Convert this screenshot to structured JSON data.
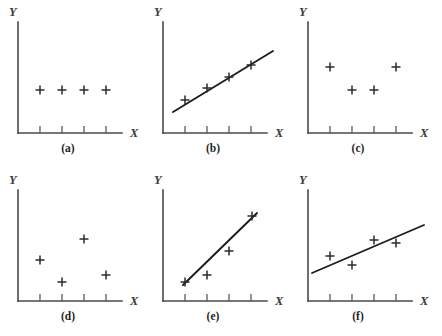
{
  "figure": {
    "background_color": "#ffffff",
    "axis_color": "#4a4a4a",
    "line_color": "#1c1c1c",
    "marker_color": "#2a2a2a",
    "marker_glyph": "plus",
    "panel_count": 6,
    "columns": 3,
    "rows": 2
  },
  "chart_data": [
    {
      "type": "scatter",
      "title": "(a)",
      "xlabel": "X",
      "ylabel": "Y",
      "x": [
        1,
        2,
        3,
        4
      ],
      "y": [
        3,
        3,
        3,
        3
      ],
      "xticks": [
        1,
        2,
        3,
        4
      ],
      "yticks": [],
      "grid": false,
      "legend": null,
      "trend_line": null,
      "description": "no correlation - flat horizontal scatter"
    },
    {
      "type": "scatter",
      "title": "(b)",
      "xlabel": "X",
      "ylabel": "Y",
      "x": [
        1,
        2,
        3,
        4
      ],
      "y": [
        1.55,
        2.22,
        2.9,
        3.58
      ],
      "xticks": [
        1,
        2,
        3,
        4
      ],
      "yticks": [],
      "grid": false,
      "legend": null,
      "trend_line": {
        "x": [
          0.45,
          4.95
        ],
        "y": [
          1.18,
          4.22
        ]
      },
      "description": "perfect positive linear correlation"
    },
    {
      "type": "scatter",
      "title": "(c)",
      "xlabel": "X",
      "ylabel": "Y",
      "x": [
        1,
        2,
        3,
        4
      ],
      "y": [
        3.65,
        2.6,
        2.6,
        3.65
      ],
      "xticks": [
        1,
        2,
        3,
        4
      ],
      "yticks": [],
      "grid": false,
      "legend": null,
      "trend_line": null,
      "description": "curvilinear / U-shaped relationship, zero linear correlation"
    },
    {
      "type": "scatter",
      "title": "(d)",
      "xlabel": "X",
      "ylabel": "Y",
      "x": [
        1,
        2,
        3,
        4
      ],
      "y": [
        2.3,
        1.3,
        3.25,
        1.65
      ],
      "xticks": [
        1,
        2,
        3,
        4
      ],
      "yticks": [],
      "grid": false,
      "legend": null,
      "trend_line": null,
      "description": "no relationship - random scatter"
    },
    {
      "type": "scatter",
      "title": "(e)",
      "xlabel": "X",
      "ylabel": "Y",
      "x": [
        1,
        2,
        3,
        4
      ],
      "y": [
        1.2,
        1.5,
        2.6,
        4.25
      ],
      "xticks": [
        1,
        2,
        3,
        4
      ],
      "yticks": [],
      "grid": false,
      "legend": null,
      "trend_line": {
        "x": [
          0.92,
          4.1
        ],
        "y": [
          1.1,
          4.3
        ]
      },
      "description": "strong positive correlation with fitted regression line"
    },
    {
      "type": "scatter",
      "title": "(f)",
      "xlabel": "X",
      "ylabel": "Y",
      "x": [
        1,
        2,
        3,
        4
      ],
      "y": [
        2.35,
        1.9,
        3.1,
        2.95
      ],
      "xticks": [
        1,
        2,
        3,
        4
      ],
      "yticks": [],
      "grid": false,
      "legend": null,
      "trend_line": {
        "x": [
          0.3,
          5.4
        ],
        "y": [
          1.4,
          3.6
        ]
      },
      "description": "moderate positive correlation with fitted regression line"
    }
  ],
  "panels": [
    {
      "id": "a",
      "caption": "(a)",
      "xlabel": "X",
      "ylabel": "Y",
      "markers": [
        [
          40,
          90
        ],
        [
          62,
          90
        ],
        [
          84,
          90
        ],
        [
          106,
          90
        ]
      ],
      "line": null
    },
    {
      "id": "b",
      "caption": "(b)",
      "xlabel": "X",
      "ylabel": "Y",
      "markers": [
        [
          40,
          100
        ],
        [
          62,
          88
        ],
        [
          84,
          77
        ],
        [
          106,
          65
        ]
      ],
      "line": [
        28,
        112,
        128,
        51
      ]
    },
    {
      "id": "c",
      "caption": "(c)",
      "xlabel": "X",
      "ylabel": "Y",
      "markers": [
        [
          40,
          67
        ],
        [
          62,
          90
        ],
        [
          84,
          90
        ],
        [
          106,
          67
        ]
      ],
      "line": null
    },
    {
      "id": "d",
      "caption": "(d)",
      "xlabel": "X",
      "ylabel": "Y",
      "markers": [
        [
          40,
          92
        ],
        [
          62,
          114
        ],
        [
          84,
          71
        ],
        [
          106,
          107
        ]
      ],
      "line": null
    },
    {
      "id": "e",
      "caption": "(e)",
      "xlabel": "X",
      "ylabel": "Y",
      "markers": [
        [
          40,
          114
        ],
        [
          62,
          107
        ],
        [
          84,
          83
        ],
        [
          107,
          48
        ]
      ],
      "line": [
        38,
        117,
        112,
        45
      ]
    },
    {
      "id": "f",
      "caption": "(f)",
      "xlabel": "X",
      "ylabel": "Y",
      "markers": [
        [
          40,
          88
        ],
        [
          62,
          97
        ],
        [
          84,
          72
        ],
        [
          106,
          75
        ]
      ],
      "line": [
        22,
        105,
        134,
        57
      ]
    }
  ],
  "geometry": {
    "panel_width": 145,
    "panel_height": 168,
    "y_axis_x": 18,
    "y_axis_top": 22,
    "x_axis_y": 133,
    "x_axis_right": 122,
    "tick_positions": [
      40,
      62,
      84,
      106
    ],
    "tick_length": 7,
    "marker_size": 4.5,
    "panel_origins": [
      [
        0,
        0
      ],
      [
        145,
        0
      ],
      [
        290,
        0
      ],
      [
        0,
        168
      ],
      [
        145,
        168
      ],
      [
        290,
        168
      ]
    ],
    "y_label_pos": [
      9,
      16
    ],
    "x_label_pos": [
      130,
      137
    ],
    "caption_pos": [
      68,
      152
    ]
  }
}
